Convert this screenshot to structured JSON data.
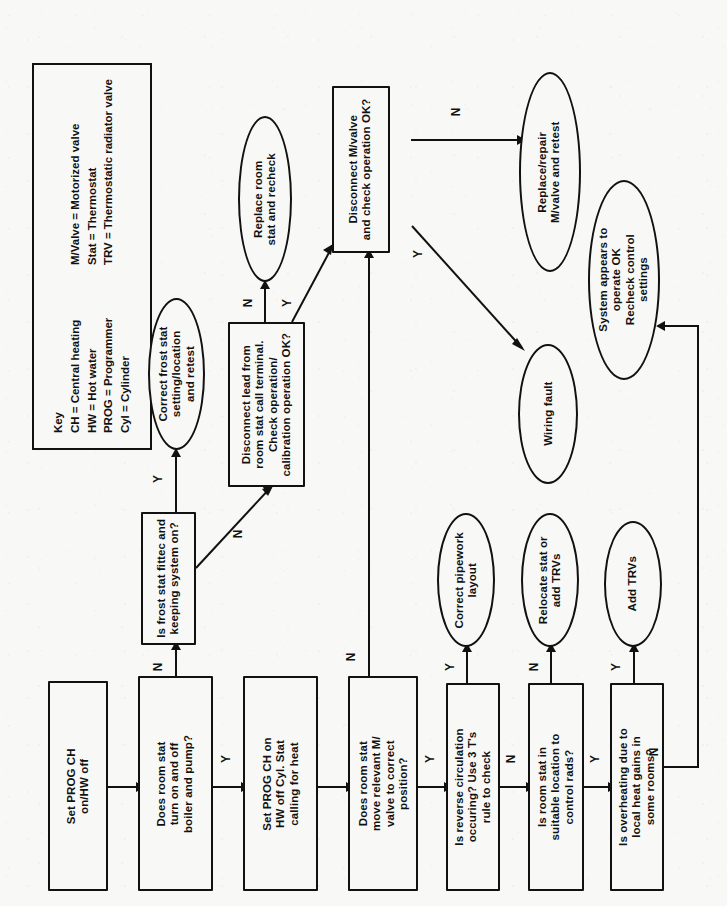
{
  "diagram": {
    "orientation": "text rotated 90 degrees (landscape artwork on portrait page)",
    "background_color": "#f8f8f6",
    "line_color": "#111111"
  },
  "key": {
    "heading": "Key",
    "entries": [
      {
        "left": "CH = Central heating",
        "right": "M/Valve = Motorized valve"
      },
      {
        "left": "HW = Hot water",
        "right": "Stat = Thermostat"
      },
      {
        "left": "PROG = Programmer",
        "right": "TRV = Thermostatic radiator valve"
      },
      {
        "left": "Cyl = Cylinder",
        "right": ""
      }
    ]
  },
  "nodes": {
    "set_prog_ch": {
      "shape": "box",
      "label": "Set PROG CH\non/HW off"
    },
    "does_room_stat_turn": {
      "shape": "box",
      "label": "Does room stat\nturn on and off\nboiler and pump?"
    },
    "set_prog_ch_hw_off": {
      "shape": "box",
      "label": "Set PROG CH on\nHW off Cyl. Stat\ncalling for heat"
    },
    "does_room_stat_move": {
      "shape": "box",
      "label": "Does room stat\nmove relevant M/\nvalve to correct\nposition?"
    },
    "reverse_circulation": {
      "shape": "box",
      "label": "Is reverse circulation\noccuring? Use 3 T's\nrule to check"
    },
    "room_stat_location": {
      "shape": "box",
      "label": "Is room stat in\nsuitable location to\ncontrol rads?"
    },
    "overheating": {
      "shape": "box",
      "label": "Is overheating due to\nlocal heat gains in\nsome rooms?"
    },
    "frost_stat": {
      "shape": "box",
      "label": "Is frost stat fittec and\nkeeping system on?"
    },
    "disconnect_lead": {
      "shape": "box",
      "label": "Disconnect lead from\nroom stat call terminal.\nCheck operation/\ncalibration operation OK?"
    },
    "disconnect_mvalve": {
      "shape": "box",
      "label": "Disconnect M/valve\nand check operation OK?"
    },
    "correct_frost_stat": {
      "shape": "oval",
      "label": "Correct frost stat\nsetting/location\nand retest"
    },
    "replace_room_stat": {
      "shape": "oval",
      "label": "Replace room\nstat and recheck"
    },
    "replace_mvalve": {
      "shape": "oval",
      "label": "Replace/repair\nM/valve and retest"
    },
    "wiring_fault": {
      "shape": "oval",
      "label": "Wiring fault"
    },
    "system_ok": {
      "shape": "oval",
      "label": "System appears to\noperate OK\nRecheck control\nsettings"
    },
    "correct_pipework": {
      "shape": "oval",
      "label": "Correct pipework\nlayout"
    },
    "relocate_stat": {
      "shape": "oval",
      "label": "Relocate stat or\nadd TRVs"
    },
    "add_trvs": {
      "shape": "oval",
      "label": "Add TRVs"
    }
  },
  "edges": [
    {
      "id": "e1",
      "from": "set_prog_ch",
      "to": "does_room_stat_turn",
      "label": ""
    },
    {
      "id": "e2",
      "from": "does_room_stat_turn",
      "to": "frost_stat",
      "label": "N"
    },
    {
      "id": "e3",
      "from": "does_room_stat_turn",
      "to": "set_prog_ch_hw_off",
      "label": "Y"
    },
    {
      "id": "e4",
      "from": "frost_stat",
      "to": "correct_frost_stat",
      "label": "Y"
    },
    {
      "id": "e5",
      "from": "frost_stat",
      "to": "disconnect_lead",
      "label": "N"
    },
    {
      "id": "e6",
      "from": "disconnect_lead",
      "to": "replace_room_stat",
      "label": "N"
    },
    {
      "id": "e7",
      "from": "disconnect_lead",
      "to": "disconnect_mvalve",
      "label": "Y"
    },
    {
      "id": "e8",
      "from": "set_prog_ch_hw_off",
      "to": "does_room_stat_move",
      "label": ""
    },
    {
      "id": "e9",
      "from": "does_room_stat_move",
      "to": "disconnect_mvalve",
      "label": "N"
    },
    {
      "id": "e10",
      "from": "does_room_stat_move",
      "to": "reverse_circulation",
      "label": "Y"
    },
    {
      "id": "e11",
      "from": "disconnect_mvalve",
      "to": "replace_mvalve",
      "label": "N"
    },
    {
      "id": "e12",
      "from": "disconnect_mvalve",
      "to": "wiring_fault",
      "label": "Y"
    },
    {
      "id": "e13",
      "from": "reverse_circulation",
      "to": "correct_pipework",
      "label": "Y"
    },
    {
      "id": "e14",
      "from": "reverse_circulation",
      "to": "room_stat_location",
      "label": "N"
    },
    {
      "id": "e15",
      "from": "room_stat_location",
      "to": "relocate_stat",
      "label": "N"
    },
    {
      "id": "e16",
      "from": "room_stat_location",
      "to": "overheating",
      "label": "Y"
    },
    {
      "id": "e17",
      "from": "overheating",
      "to": "add_trvs",
      "label": "Y"
    },
    {
      "id": "e18",
      "from": "overheating",
      "to": "system_ok",
      "label": "N"
    }
  ]
}
